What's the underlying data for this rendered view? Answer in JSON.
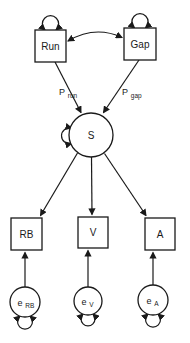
{
  "diagram": {
    "kind": "structural-equation-path-diagram",
    "exogenous": [
      {
        "label": "Run"
      },
      {
        "label": "Gap"
      }
    ],
    "latent": {
      "label": "S"
    },
    "indicators": [
      {
        "label": "RB"
      },
      {
        "label": "V"
      },
      {
        "label": "A"
      }
    ],
    "errors": [
      {
        "base": "e",
        "sub": "RB"
      },
      {
        "base": "e",
        "sub": "V"
      },
      {
        "base": "e",
        "sub": "A"
      }
    ],
    "path_coefficients": [
      {
        "base": "P",
        "sub": "run"
      },
      {
        "base": "P",
        "sub": "gap"
      }
    ],
    "colors": {
      "line": "#1a1a1a",
      "node_fill": "#ffffff",
      "background": "#ffffff"
    }
  }
}
